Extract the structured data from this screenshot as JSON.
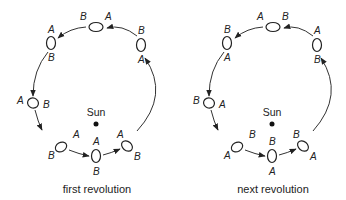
{
  "diagrams": [
    {
      "caption": "first revolution",
      "sun_label": "Sun",
      "positions": [
        {
          "end1": "B",
          "end2": "A"
        },
        {
          "end1": "B",
          "end2": "A"
        },
        {
          "end1": "A",
          "end2": "B"
        },
        {
          "end1": "A",
          "end2": "B"
        },
        {
          "end1": "B",
          "end2": "A"
        },
        {
          "end1": "A",
          "end2": "B"
        },
        {
          "end1": "A",
          "end2": "B"
        }
      ]
    },
    {
      "caption": "next revolution",
      "sun_label": "Sun",
      "positions": [
        {
          "end1": "A",
          "end2": "B"
        },
        {
          "end1": "A",
          "end2": "B"
        },
        {
          "end1": "B",
          "end2": "A"
        },
        {
          "end1": "B",
          "end2": "A"
        },
        {
          "end1": "A",
          "end2": "B"
        },
        {
          "end1": "B",
          "end2": "A"
        },
        {
          "end1": "B",
          "end2": "A"
        }
      ]
    }
  ]
}
